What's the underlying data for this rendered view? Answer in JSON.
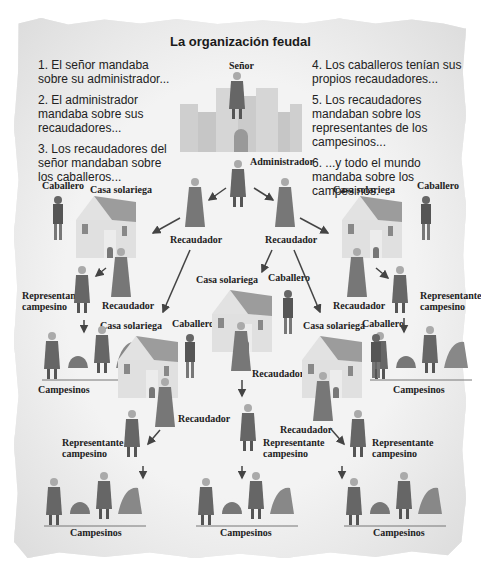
{
  "title": "La organización feudal",
  "notes_left": [
    "1. El señor mandaba sobre su administrador...",
    "2. El administrador mandaba sobre sus recaudadores...",
    "3. Los recaudadores del señor mandaban sobre los caballeros..."
  ],
  "notes_right": [
    "4. Los caballeros tenían sus propios recaudadores...",
    "5. Los recaudadores mandaban sobre los representantes de los campesinos...",
    "6. ...y todo el mundo mandaba sobre los campesinos."
  ],
  "labels": {
    "senor": "Señor",
    "administrador": "Administrador",
    "recaudador": "Recaudador",
    "caballero": "Caballero",
    "casa": "Casa solariega",
    "representante_1": "Representante",
    "representante_2": "campesino",
    "campesinos": "Campesinos"
  },
  "colors": {
    "paper": "#ececec",
    "text": "#1a1a1a",
    "figure_dark": "#555555",
    "figure_mid": "#8a8a8a",
    "building": "#d8d8d8",
    "roof": "#9a9a9a",
    "arrow": "#444444"
  }
}
